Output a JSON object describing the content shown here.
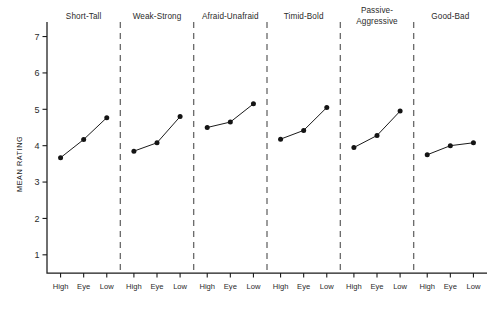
{
  "chart_data": {
    "type": "line",
    "title": "",
    "subtitle": "",
    "xlabel": "",
    "ylabel": "MEAN RATING",
    "ylim": [
      0.5,
      7.4
    ],
    "yticks": [
      1,
      2,
      3,
      4,
      5,
      6,
      7
    ],
    "ytick_labels": [
      "1",
      "2",
      "3",
      "4",
      "5",
      "6",
      "7"
    ],
    "categories": [
      "High",
      "Eye",
      "Low"
    ],
    "grid": false,
    "legend": "none",
    "panel_layout": "six side-by-side panels separated by vertical dashed lines, shared y-axis",
    "marker": "filled circle",
    "panels": [
      {
        "title": "Short-Tall",
        "title_lines": [
          "Short-Tall"
        ],
        "values": [
          3.67,
          4.17,
          4.77
        ]
      },
      {
        "title": "Weak-Strong",
        "title_lines": [
          "Weak-Strong"
        ],
        "values": [
          3.85,
          4.08,
          4.8
        ]
      },
      {
        "title": "Afraid-Unafraid",
        "title_lines": [
          "Afraid-Unafraid"
        ],
        "values": [
          4.5,
          4.65,
          5.15
        ]
      },
      {
        "title": "Timid-Bold",
        "title_lines": [
          "Timid-Bold"
        ],
        "values": [
          4.18,
          4.42,
          5.05
        ]
      },
      {
        "title": "Passive-Aggressive",
        "title_lines": [
          "Passive-",
          "Aggressive"
        ],
        "values": [
          3.95,
          4.28,
          4.95
        ]
      },
      {
        "title": "Good-Bad",
        "title_lines": [
          "Good-Bad"
        ],
        "values": [
          3.75,
          4.0,
          4.08
        ]
      }
    ],
    "series": [
      {
        "name": "Short-Tall",
        "values": [
          3.67,
          4.17,
          4.77
        ]
      },
      {
        "name": "Weak-Strong",
        "values": [
          3.85,
          4.08,
          4.8
        ]
      },
      {
        "name": "Afraid-Unafraid",
        "values": [
          4.5,
          4.65,
          5.15
        ]
      },
      {
        "name": "Timid-Bold",
        "values": [
          4.18,
          4.42,
          5.05
        ]
      },
      {
        "name": "Passive-Aggressive",
        "values": [
          3.95,
          4.28,
          4.95
        ]
      },
      {
        "name": "Good-Bad",
        "values": [
          3.75,
          4.0,
          4.08
        ]
      }
    ],
    "colors": {
      "ink": "#1b1b1b",
      "marker": "#141414",
      "separator": "#6d6d6d",
      "background": "#ffffff"
    }
  }
}
